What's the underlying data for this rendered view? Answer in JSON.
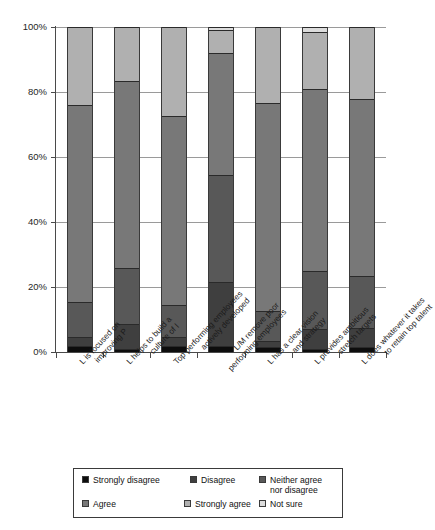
{
  "chart_data": {
    "type": "bar",
    "subtype": "stacked-100-percent",
    "title": "",
    "xlabel": "",
    "ylabel": "",
    "ylim": [
      0,
      100
    ],
    "ytick_labels": [
      "0%",
      "20%",
      "40%",
      "60%",
      "80%",
      "100%"
    ],
    "ytick_values": [
      0,
      20,
      40,
      60,
      80,
      100
    ],
    "grid": true,
    "legend_position": "bottom",
    "categories": [
      "L is focused on improving P",
      "L helps to build a culture of I",
      "Top performing employees actively developed",
      "L/M remove poor performing employees",
      "L has a clear vision and strategy",
      "L provides ambitious stretch targets",
      "L does whatever it takes to retain top talent"
    ],
    "category_lines": [
      [
        "L is focused on",
        "improving P"
      ],
      [
        "L helps to build a",
        "culture of I"
      ],
      [
        "Top performing employees",
        "actively developed"
      ],
      [
        "L/M remove poor",
        "performing employees"
      ],
      [
        "L has a clear vision",
        "and strategy"
      ],
      [
        "L provides ambitious",
        "stretch targets"
      ],
      [
        "L does whatever it takes",
        "to retain top talent"
      ]
    ],
    "series": [
      {
        "name": "Strongly disagree",
        "color": "#0d0d0d",
        "values": [
          2.0,
          1.0,
          2.0,
          2.0,
          1.5,
          0.8,
          1.5
        ]
      },
      {
        "name": "Disagree",
        "color": "#3f3f3f",
        "values": [
          2.5,
          7.5,
          2.5,
          19.5,
          2.0,
          6.2,
          6.0
        ]
      },
      {
        "name": "Neither agree nor disagree",
        "color": "#585858",
        "values": [
          11.0,
          17.5,
          10.0,
          33.0,
          9.0,
          18.0,
          16.0
        ]
      },
      {
        "name": "Agree",
        "color": "#787878",
        "values": [
          60.5,
          57.5,
          58.0,
          37.5,
          64.0,
          56.0,
          54.5
        ]
      },
      {
        "name": "Strongly agree",
        "color": "#b0b0b0",
        "values": [
          24.0,
          16.5,
          27.5,
          7.0,
          23.5,
          17.5,
          22.0
        ]
      },
      {
        "name": "Not sure",
        "color": "#dcdcdc",
        "values": [
          0.0,
          0.0,
          0.0,
          1.0,
          0.0,
          1.5,
          0.0
        ]
      }
    ]
  },
  "legend": {
    "items": [
      {
        "label": "Strongly disagree",
        "color": "#0d0d0d"
      },
      {
        "label": "Disagree",
        "color": "#3f3f3f"
      },
      {
        "label": "Neither agree\nnor disagree",
        "color": "#585858"
      },
      {
        "label": "Agree",
        "color": "#787878"
      },
      {
        "label": "Strongly agree",
        "color": "#b0b0b0"
      },
      {
        "label": "Not sure",
        "color": "#dcdcdc"
      }
    ]
  }
}
